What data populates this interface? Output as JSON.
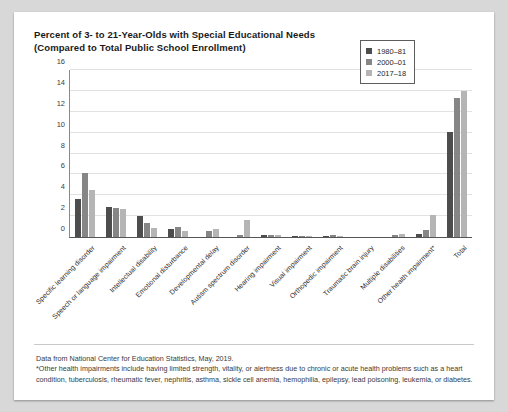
{
  "title": {
    "line1": "Percent of 3- to 21-Year-Olds with Special Educational Needs",
    "line2": "(Compared to Total Public School Enrollment)"
  },
  "legend": {
    "position": "top-right",
    "entries": [
      {
        "label": "1980–81",
        "color": "#4d4d4d"
      },
      {
        "label": "2000–01",
        "color": "#868686"
      },
      {
        "label": "2017–18",
        "color": "#b5b5b5"
      }
    ]
  },
  "footer": {
    "source": "Data from National Center for Education Statistics, May, 2019.",
    "note": "*Other health impairments include having limited strength, vitality, or alertness due to chronic or acute health problems such as a heart condition, tuberculosis, rheumatic fever, nephritis, asthma, sickle cell anemia, hemophilia, epilepsy, lead poisoning, leukemia, or diabetes."
  },
  "chart_data": {
    "type": "bar",
    "title": "Percent of 3- to 21-Year-Olds with Special Educational Needs (Compared to Total Public School Enrollment)",
    "xlabel": "",
    "ylabel": "",
    "ylim": [
      0,
      16
    ],
    "yticks": [
      0,
      2,
      4,
      6,
      8,
      10,
      12,
      14,
      16
    ],
    "grid": "horizontal",
    "legend_position": "upper right",
    "categories": [
      "Specific learning disorder",
      "Speech or language impairment",
      "Intellectual disability",
      "Emotional disturbance",
      "Developmental delay",
      "Autism spectrum disorder",
      "Hearing impairment",
      "Visual impairment",
      "Orthopedic impairment",
      "Traumatic brain injury",
      "Multiple disabilities",
      "Other health impairment*",
      "Total"
    ],
    "series": [
      {
        "name": "1980–81",
        "color": "#4d4d4d",
        "values": [
          3.6,
          2.9,
          2.0,
          0.8,
          0,
          0,
          0.2,
          0.1,
          0.1,
          0,
          0,
          0.3,
          10.1
        ]
      },
      {
        "name": "2000–01",
        "color": "#868686",
        "values": [
          6.1,
          2.8,
          1.3,
          1.0,
          0.6,
          0.2,
          0.2,
          0.1,
          0.2,
          0.0,
          0.2,
          0.7,
          13.3
        ]
      },
      {
        "name": "2017–18",
        "color": "#b5b5b5",
        "values": [
          4.5,
          2.7,
          0.9,
          0.6,
          0.8,
          1.6,
          0.2,
          0.1,
          0.1,
          0.0,
          0.3,
          2.1,
          14.0
        ]
      }
    ]
  }
}
